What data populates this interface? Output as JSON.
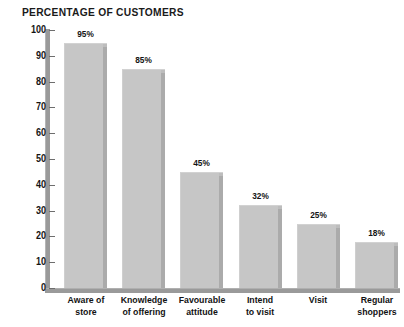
{
  "chart_data": {
    "type": "bar",
    "title": "PERCENTAGE OF CUSTOMERS",
    "xlabel": "",
    "ylabel": "",
    "ylim": [
      0,
      100
    ],
    "grid": false,
    "legend": "none",
    "orientation": "vertical",
    "value_label_suffix": "%",
    "categories": [
      "Aware of\nstore",
      "Knowledge\nof offering",
      "Favourable\nattitude",
      "Intend\nto visit",
      "Visit",
      "Regular\nshoppers"
    ],
    "values": [
      95,
      85,
      45,
      32,
      25,
      18
    ],
    "value_labels": [
      "95%",
      "85%",
      "45%",
      "32%",
      "25%",
      "18%"
    ],
    "y_ticks": [
      100,
      90,
      80,
      70,
      60,
      50,
      40,
      30,
      20,
      10,
      0
    ],
    "y_tick_labels": [
      "100",
      "90",
      "80",
      "70",
      "60",
      "50",
      "40",
      "30",
      "20",
      "10",
      "0"
    ],
    "colors": {
      "background": "#ffffff",
      "bar_fill": "#c6c6c6",
      "bar_edge": "#ababab",
      "axis": "#9a9a9a",
      "tick": "#6e6e6e",
      "text": "#141414",
      "title": "#1a1a1a"
    }
  }
}
